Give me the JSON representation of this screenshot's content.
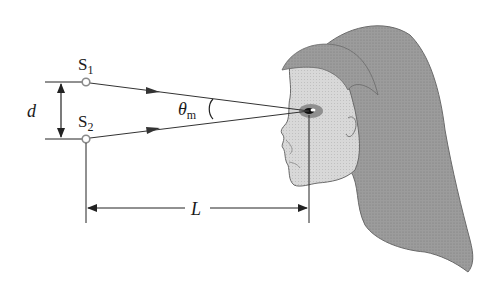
{
  "diagram": {
    "sources": [
      {
        "name": "S",
        "subscript": "1"
      },
      {
        "name": "S",
        "subscript": "2"
      }
    ],
    "separation_label": "d",
    "angle_label": {
      "symbol": "θ",
      "subscript": "m"
    },
    "distance_label": "L",
    "colors": {
      "line": "#333333",
      "source_ring": "#8a8a8a",
      "hair": "#9a9a9a",
      "skin": "#d4d4d4",
      "shadow": "#a8a8a8"
    }
  }
}
